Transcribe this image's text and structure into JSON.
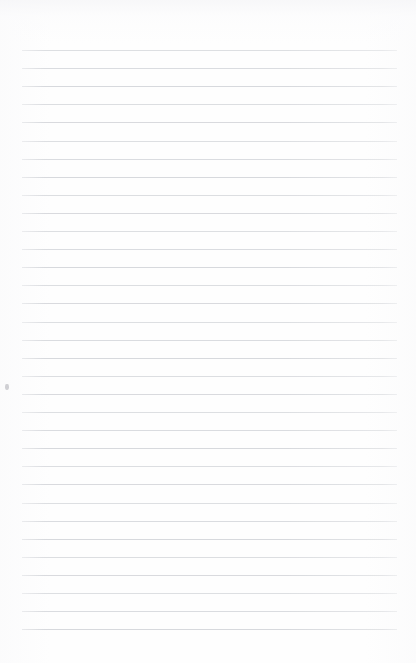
{
  "document": {
    "kind": "ruled-paper-sheet",
    "title": "Blank ruled paper",
    "body_text": "",
    "page_width": 416,
    "page_height": 663
  },
  "colors": {
    "page_background": "#fefefe",
    "paper_tint": "#f6f6f8",
    "rule_line": "#d6d8dc",
    "speck": "#d0d0d4"
  },
  "ruling": {
    "line_count": 33,
    "first_line_y": 50,
    "line_spacing": 18.1,
    "line_start_x": 22,
    "line_end_x": 397,
    "line_thickness": 1,
    "top_margin_label": "50",
    "left_margin_label": "22",
    "right_margin_label": "19"
  },
  "marks": [
    {
      "name": "left-margin-speck",
      "x": 5,
      "y": 384
    }
  ]
}
